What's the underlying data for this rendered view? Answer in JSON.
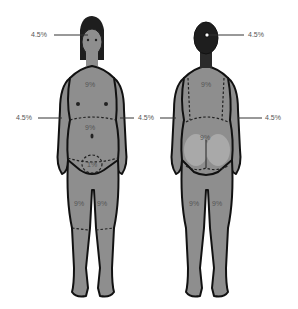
{
  "diagram": {
    "title": "",
    "colors": {
      "skin": "#8e8e8e",
      "skin_light": "#b0b0b0",
      "outline": "#111111",
      "hair": "#1e1e1e",
      "label_text": "#555555",
      "leader_line": "#333333",
      "background": "#ffffff"
    },
    "front": {
      "head_label": "4.5%",
      "left_arm_label": "4.5%",
      "right_arm_label": "4.5%",
      "chest_label": "9%",
      "abdomen_label": "9%",
      "genitals_label": "1%",
      "left_leg_label": "9%",
      "right_leg_label": "9%"
    },
    "back": {
      "head_label": "4.5%",
      "left_arm_label": "4.5%",
      "right_arm_label": "4.5%",
      "upper_back_label": "9%",
      "lower_back_label": "9%",
      "left_leg_label": "9%",
      "right_leg_label": "9%"
    }
  }
}
